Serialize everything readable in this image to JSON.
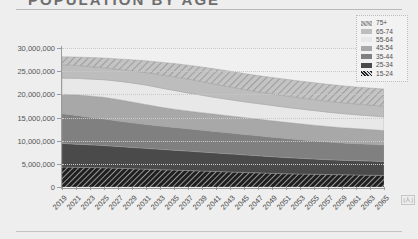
{
  "title": "POPULATION BY AGE",
  "corner_note": "(人)",
  "legend": {
    "position": "top-right",
    "items": [
      {
        "label": "75+",
        "color": "#b9b9b9",
        "pattern": "hatched"
      },
      {
        "label": "65-74",
        "color": "#bdbdbd",
        "pattern": "solid"
      },
      {
        "label": "55-64",
        "color": "#e8e8e8",
        "pattern": "solid"
      },
      {
        "label": "45-54",
        "color": "#a8a8a8",
        "pattern": "solid"
      },
      {
        "label": "35-44",
        "color": "#808080",
        "pattern": "solid"
      },
      {
        "label": "25-34",
        "color": "#4a4a4a",
        "pattern": "solid"
      },
      {
        "label": "15-24",
        "color": "#2b2b2b",
        "pattern": "hatched"
      }
    ]
  },
  "chart_data": {
    "type": "area",
    "stacked": true,
    "title": "POPULATION BY AGE",
    "xlabel": "",
    "ylabel": "",
    "ylim": [
      0,
      30000000
    ],
    "yticks": [
      0,
      5000000,
      10000000,
      15000000,
      20000000,
      25000000,
      30000000
    ],
    "ytick_labels": [
      "0",
      "5,000,000",
      "10,000,000",
      "15,000,000",
      "20,000,000",
      "25,000,000",
      "30,000,000"
    ],
    "grid": true,
    "x": [
      2019,
      2021,
      2023,
      2025,
      2027,
      2029,
      2031,
      2033,
      2035,
      2037,
      2039,
      2041,
      2043,
      2045,
      2047,
      2049,
      2051,
      2053,
      2055,
      2057,
      2059,
      2061,
      2063,
      2065
    ],
    "xtick_labels": [
      "2019",
      "2021",
      "2023",
      "2025",
      "2027",
      "2029",
      "2031",
      "2033",
      "2035",
      "2037",
      "2039",
      "2041",
      "2043",
      "2045",
      "2047",
      "2049",
      "2051",
      "2053",
      "2055",
      "2057",
      "2059",
      "2061",
      "2063",
      "2065"
    ],
    "series": [
      {
        "name": "15-24",
        "color": "#2b2b2b",
        "pattern": "hatched",
        "values": [
          4300000,
          4250000,
          4200000,
          4150000,
          4050000,
          3950000,
          3850000,
          3750000,
          3650000,
          3550000,
          3450000,
          3350000,
          3250000,
          3150000,
          3050000,
          2950000,
          2850000,
          2800000,
          2750000,
          2700000,
          2650000,
          2600000,
          2550000,
          2500000
        ]
      },
      {
        "name": "25-34",
        "color": "#4a4a4a",
        "pattern": "solid",
        "values": [
          5100000,
          5000000,
          4900000,
          4800000,
          4700000,
          4600000,
          4500000,
          4400000,
          4300000,
          4200000,
          4100000,
          4000000,
          3900000,
          3800000,
          3700000,
          3600000,
          3500000,
          3400000,
          3300000,
          3200000,
          3150000,
          3100000,
          3050000,
          3000000
        ]
      },
      {
        "name": "35-44",
        "color": "#808080",
        "pattern": "solid",
        "values": [
          6400000,
          6200000,
          5950000,
          5700000,
          5500000,
          5300000,
          5150000,
          5000000,
          4900000,
          4800000,
          4700000,
          4600000,
          4500000,
          4400000,
          4300000,
          4200000,
          4100000,
          4000000,
          3900000,
          3800000,
          3700000,
          3650000,
          3600000,
          3550000
        ]
      },
      {
        "name": "45-54",
        "color": "#a8a8a8",
        "pattern": "solid",
        "values": [
          4200000,
          4450000,
          4600000,
          4700000,
          4650000,
          4500000,
          4300000,
          4100000,
          3950000,
          3850000,
          3800000,
          3750000,
          3700000,
          3650000,
          3600000,
          3550000,
          3500000,
          3450000,
          3400000,
          3350000,
          3300000,
          3250000,
          3200000,
          3150000
        ]
      },
      {
        "name": "55-64",
        "color": "#e8e8e8",
        "pattern": "solid",
        "values": [
          3500000,
          3550000,
          3650000,
          3800000,
          3950000,
          4100000,
          4200000,
          4150000,
          4050000,
          3900000,
          3750000,
          3600000,
          3500000,
          3400000,
          3350000,
          3300000,
          3250000,
          3200000,
          3150000,
          3100000,
          3050000,
          3000000,
          2980000,
          2950000
        ]
      },
      {
        "name": "65-74",
        "color": "#bdbdbd",
        "pattern": "solid",
        "values": [
          2900000,
          2800000,
          2700000,
          2600000,
          2550000,
          2600000,
          2700000,
          2850000,
          2950000,
          3000000,
          2950000,
          2850000,
          2750000,
          2650000,
          2550000,
          2500000,
          2450000,
          2400000,
          2380000,
          2360000,
          2340000,
          2320000,
          2300000,
          2280000
        ]
      },
      {
        "name": "75+",
        "color": "#b9b9b9",
        "pattern": "hatched",
        "values": [
          1700000,
          1800000,
          1950000,
          2100000,
          2250000,
          2400000,
          2550000,
          2700000,
          2850000,
          3000000,
          3150000,
          3300000,
          3400000,
          3450000,
          3500000,
          3550000,
          3600000,
          3620000,
          3640000,
          3650000,
          3660000,
          3670000,
          3680000,
          3700000
        ]
      }
    ]
  }
}
